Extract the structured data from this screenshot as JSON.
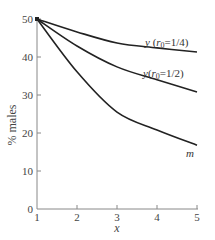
{
  "chart_data": {
    "type": "line",
    "title": "",
    "xlabel": "x",
    "ylabel": "% males",
    "xlim": [
      1,
      5
    ],
    "ylim": [
      0,
      50
    ],
    "x_ticks": [
      "1",
      "2",
      "3",
      "4",
      "5"
    ],
    "y_ticks": [
      "0",
      "10",
      "20",
      "30",
      "40",
      "50"
    ],
    "grid": false,
    "legend": "inline labels at right end of curves",
    "x": [
      1,
      2,
      3,
      4,
      5
    ],
    "series": [
      {
        "name": "y (r0=1/4)",
        "label_prefix": "y",
        "label_var": "r",
        "label_sub": "0",
        "label_value": "=1/4",
        "values": [
          50,
          46.6,
          43.7,
          42.4,
          41.3
        ]
      },
      {
        "name": "y(r0=1/2)",
        "label_prefix": "y",
        "label_var": "r",
        "label_sub": "0",
        "label_value": "=1/2",
        "values": [
          50,
          42.9,
          37.4,
          34.0,
          30.8
        ]
      },
      {
        "name": "m",
        "values": [
          50,
          36.1,
          25.5,
          20.8,
          16.8
        ]
      }
    ]
  }
}
